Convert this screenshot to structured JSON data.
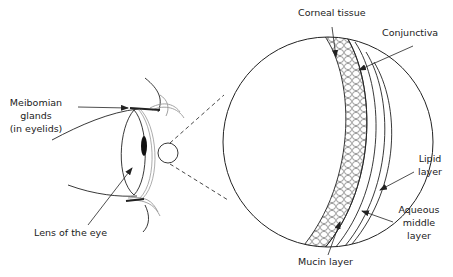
{
  "diagram": {
    "labels": {
      "meibomian": [
        "Meibomian",
        "glands",
        "(in eyelids)"
      ],
      "lens": "Lens of the eye",
      "corneal": "Corneal tissue",
      "conjunctiva": "Conjunctiva",
      "lipid": [
        "Lipid",
        "layer"
      ],
      "aqueous": [
        "Aqueous",
        "middle",
        "layer"
      ],
      "mucin": "Mucin layer"
    },
    "colors": {
      "stroke": "#222222",
      "background": "#ffffff"
    }
  }
}
